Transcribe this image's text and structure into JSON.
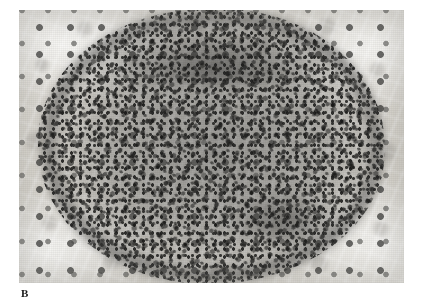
{
  "page": {
    "background_color": "#ffffff",
    "width": 421,
    "height": 304
  },
  "figure": {
    "panel_label": "B",
    "caption": "",
    "modality": "light microscopy",
    "stain": "hematoxylin and eosin (reproduced in grayscale)",
    "image": {
      "left": 19,
      "top": 10,
      "width": 385,
      "height": 273,
      "is_grayscale": true,
      "background_tone": "#ddd9d2",
      "darkest_tone": "#1d1d1c",
      "alt": "Grayscale photomicrograph of liver tissue showing a large oval, densely cellular lymphocytic aggregate occupying most of the field, with a darker, denser rim superiorly and inferior-right, surrounded by paler hepatocyte parenchyma containing scattered larger round nuclei."
    },
    "regions": [
      {
        "name": "lymphoid-aggregate",
        "description": "central oval densely packed small dark nuclei",
        "tone": "dark gray"
      },
      {
        "name": "aggregate-rim",
        "description": "darker, more densely packed peripheral band of the aggregate, most prominent superiorly",
        "tone": "near black"
      },
      {
        "name": "hepatocyte-parenchyma",
        "description": "pale surrounding liver tissue with sparse larger round nuclei and sinusoidal clefts",
        "tone": "light gray"
      }
    ]
  }
}
